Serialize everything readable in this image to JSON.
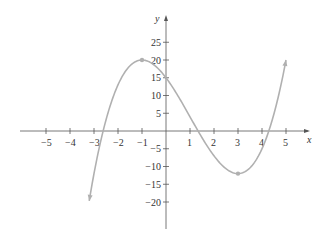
{
  "chart_data": {
    "type": "line",
    "title": "",
    "xlabel": "x",
    "ylabel": "y",
    "xlim": [
      -6,
      6
    ],
    "ylim": [
      -25,
      30
    ],
    "grid": false,
    "x_ticks": [
      -5,
      -4,
      -3,
      -2,
      -1,
      1,
      2,
      3,
      4,
      5
    ],
    "y_ticks": [
      25,
      20,
      15,
      10,
      5,
      -5,
      -10,
      -15,
      -20
    ],
    "series": [
      {
        "name": "f(x) = x^3 - 3x^2 - 9x + 15",
        "color": "#b0b0b0",
        "x_range": [
          -3.2,
          5
        ],
        "endpoints_arrows": true,
        "key_points": [
          {
            "x": -1,
            "y": 20,
            "label": "local max"
          },
          {
            "x": 3,
            "y": -12,
            "label": "local min"
          }
        ],
        "sample_points": [
          {
            "x": -3.2,
            "y": -19.7
          },
          {
            "x": -3,
            "y": -12
          },
          {
            "x": -2,
            "y": 13
          },
          {
            "x": -1,
            "y": 20
          },
          {
            "x": 0,
            "y": 15
          },
          {
            "x": 1,
            "y": 4
          },
          {
            "x": 2,
            "y": -7
          },
          {
            "x": 3,
            "y": -12
          },
          {
            "x": 4,
            "y": -5
          },
          {
            "x": 5,
            "y": 20
          }
        ]
      }
    ]
  },
  "labels": {
    "x_axis": "x",
    "y_axis": "y",
    "x_ticks": [
      "−5",
      "−4",
      "−3",
      "−2",
      "−1",
      "1",
      "2",
      "3",
      "4",
      "5"
    ],
    "y_ticks": [
      "25",
      "20",
      "15",
      "10",
      "5",
      "−5",
      "−10",
      "−15",
      "−20"
    ]
  },
  "colors": {
    "axis": "#555555",
    "curve": "#b0b0b0",
    "text": "#333333"
  }
}
